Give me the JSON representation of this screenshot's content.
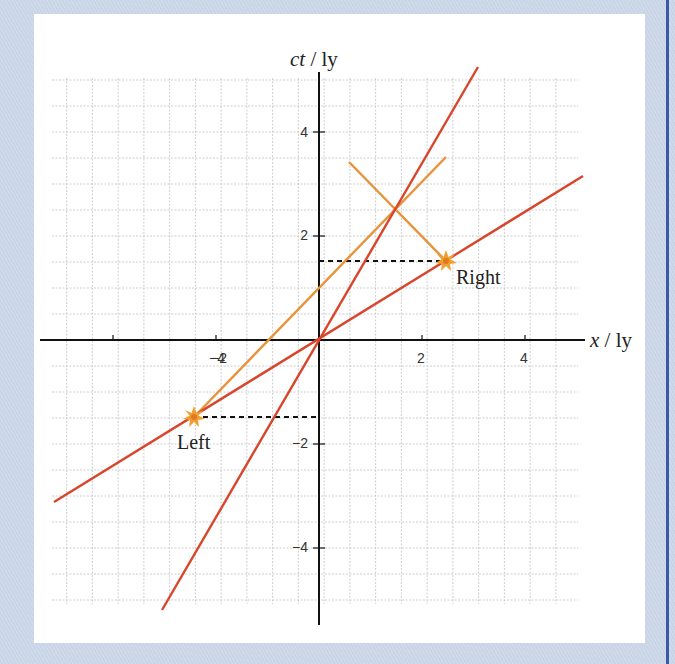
{
  "chart_data": {
    "type": "line",
    "title": "",
    "xlabel": "x / ly",
    "ylabel": "ct / ly",
    "xlim": [
      -5.3,
      5.2
    ],
    "ylim": [
      -5.6,
      5.3
    ],
    "grid": true,
    "grid_step": 0.5,
    "x_ticks": [
      -4,
      -2,
      2,
      4
    ],
    "y_ticks": [
      4,
      2,
      -2,
      -4
    ],
    "x_tick_labels": [
      "−4",
      "−2",
      "2",
      "4"
    ],
    "y_tick_labels": [
      "4",
      "2",
      "−2",
      "−4"
    ],
    "series": [
      {
        "name": "steep red worldline",
        "color": "#d9452b",
        "equation": "ct = 2x",
        "points": [
          [
            -3.05,
            -5.2
          ],
          [
            3.1,
            5.2
          ]
        ]
      },
      {
        "name": "shallow red line",
        "color": "#d9452b",
        "equation": "ct = 0.6x",
        "points": [
          [
            -5.15,
            -3.11
          ],
          [
            5.1,
            3.16
          ]
        ]
      },
      {
        "name": "orange light ray from Left",
        "color": "#e8923a",
        "equation": "ct = x + 1",
        "points": [
          [
            -2.5,
            -1.5
          ],
          [
            2.5,
            3.5
          ]
        ]
      },
      {
        "name": "orange light ray to Right",
        "color": "#e8923a",
        "equation": "ct = -x + 4",
        "points": [
          [
            0.6,
            3.4
          ],
          [
            2.5,
            1.5
          ]
        ]
      },
      {
        "name": "dashed level Right",
        "style": "dashed",
        "color": "#111111",
        "points": [
          [
            0,
            1.5
          ],
          [
            2.5,
            1.5
          ]
        ]
      },
      {
        "name": "dashed level Left",
        "style": "dashed",
        "color": "#111111",
        "points": [
          [
            -2.5,
            -1.5
          ],
          [
            0,
            -1.5
          ]
        ]
      }
    ],
    "events": [
      {
        "label": "Left",
        "x": -2.5,
        "ct": -1.5
      },
      {
        "label": "Right",
        "x": 2.5,
        "ct": 1.5
      }
    ],
    "annotations": [
      "Left",
      "Right"
    ],
    "intersection": {
      "x": 1.5,
      "ct": 2.5
    }
  },
  "labels": {
    "y_axis": "ct / ly",
    "x_axis": "x / ly",
    "left_event": "Left",
    "right_event": "Right",
    "tick_x_m4": "−4",
    "tick_x_m2": "−2",
    "tick_x_2": "2",
    "tick_x_4": "4",
    "tick_y_4": "4",
    "tick_y_2": "2",
    "tick_y_m2": "−2",
    "tick_y_m4": "−4"
  },
  "colors": {
    "red": "#d9452b",
    "orange": "#e8923a",
    "star": "#f0a030",
    "background": "#c9d4e6",
    "border": "#3a5aa8"
  }
}
